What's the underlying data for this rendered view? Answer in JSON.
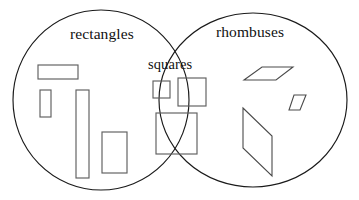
{
  "diagram": {
    "type": "venn",
    "title": "",
    "canvas": {
      "width": 359,
      "height": 200,
      "background": "#ffffff"
    },
    "stroke_colors": {
      "set_outline": "#1a1a1a",
      "shape_outline": "#5f5f5f",
      "rhombus_outline": "#4a4a4a"
    },
    "sets": [
      {
        "id": "rectangles",
        "label": "rectangles",
        "label_position": {
          "x": 70,
          "y": 26
        },
        "ellipse": {
          "cx": 101,
          "cy": 100,
          "rx": 88,
          "ry": 90
        }
      },
      {
        "id": "rhombuses",
        "label": "rhombuses",
        "label_position": {
          "x": 216,
          "y": 24
        },
        "ellipse": {
          "cx": 253,
          "cy": 100,
          "rx": 94,
          "ry": 87
        }
      }
    ],
    "intersection": {
      "id": "squares",
      "label": "squares",
      "label_position": {
        "x": 148,
        "y": 57
      }
    },
    "members": {
      "rectangles_only": [
        {
          "name": "wide-rectangle",
          "shape": "rect",
          "x": 38,
          "y": 65,
          "width": 40,
          "height": 14
        },
        {
          "name": "small-vertical-rectangle",
          "shape": "rect",
          "x": 40,
          "y": 90,
          "width": 11,
          "height": 27
        },
        {
          "name": "tall-narrow-rectangle",
          "shape": "rect",
          "x": 76,
          "y": 90,
          "width": 13,
          "height": 88
        },
        {
          "name": "medium-vertical-rectangle",
          "shape": "rect",
          "x": 102,
          "y": 132,
          "width": 25,
          "height": 41
        }
      ],
      "squares_intersection": [
        {
          "name": "small-square",
          "shape": "rect",
          "x": 153,
          "y": 81,
          "width": 17,
          "height": 17
        },
        {
          "name": "medium-square",
          "shape": "rect",
          "x": 178,
          "y": 78,
          "width": 28,
          "height": 28
        },
        {
          "name": "large-square",
          "shape": "rect",
          "x": 156,
          "y": 113,
          "width": 41,
          "height": 41
        }
      ],
      "rhombuses_only": [
        {
          "name": "flat-rhombus",
          "shape": "polygon",
          "points": "244,80 262,67 293,67 276,80"
        },
        {
          "name": "small-rhombus",
          "shape": "polygon",
          "points": "289,110 294,95 306,95 300,110"
        },
        {
          "name": "large-rhombus",
          "shape": "polygon",
          "points": "243,108 243,108 272,136 272,176 243,148"
        },
        {
          "name": "large-rhombus-alt",
          "shape": "polygon",
          "points": "243,108 272,136 272,176 243,148"
        }
      ]
    }
  }
}
